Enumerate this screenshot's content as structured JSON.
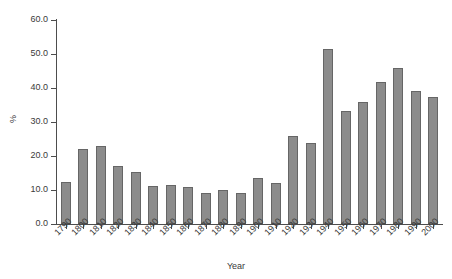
{
  "chart_data": {
    "type": "bar",
    "title": "",
    "subtitle": "",
    "xlabel": "Year",
    "ylabel": "%",
    "categories": [
      "1790",
      "1800",
      "1810",
      "1820",
      "1830",
      "1840",
      "1850",
      "1860",
      "1870",
      "1880",
      "1890",
      "1900",
      "1910",
      "1920",
      "1930",
      "1940",
      "1950",
      "1960",
      "1970",
      "1980",
      "1990",
      "2000"
    ],
    "values": [
      12.3,
      22.0,
      22.8,
      17.0,
      15.3,
      11.3,
      11.5,
      11.0,
      9.2,
      10.0,
      9.0,
      13.6,
      12.0,
      26.0,
      23.8,
      51.5,
      33.2,
      36.0,
      41.8,
      45.8,
      39.0,
      37.3
    ],
    "ylim": [
      0.0,
      60.0
    ],
    "ytick_values": [
      0.0,
      10.0,
      20.0,
      30.0,
      40.0,
      50.0,
      60.0
    ],
    "ytick_labels": [
      "0.0",
      "10.0",
      "20.0",
      "30.0",
      "40.0",
      "50.0",
      "60.0"
    ],
    "grid": false,
    "legend": false,
    "legend_position": "none",
    "bar_color": "#8c8c8c",
    "bar_edge_color": "#666666",
    "axis_color": "#4d4d4d",
    "text_color": "#3a3a3a",
    "background": "#ffffff"
  }
}
